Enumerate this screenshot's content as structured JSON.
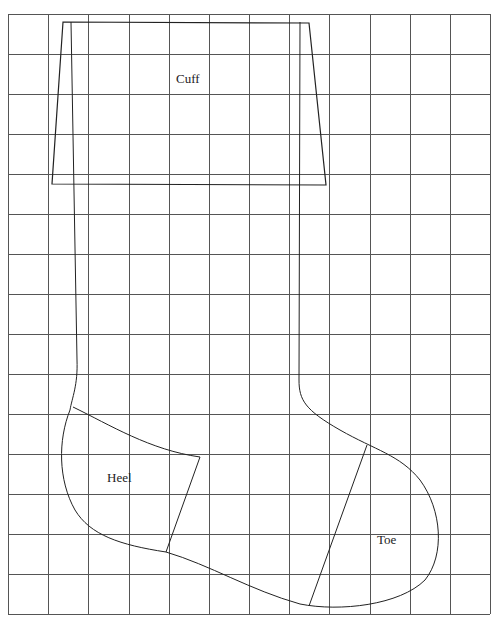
{
  "diagram": {
    "type": "sewing-pattern",
    "background": "#ffffff",
    "line_color": "#333333",
    "grid": {
      "color": "#555555",
      "left": 8,
      "top": 14,
      "right": 490,
      "bottom": 614,
      "columns": 12,
      "rows": 15
    },
    "labels": {
      "cuff": "Cuff",
      "heel": "Heel",
      "toe": "Toe"
    },
    "pieces": [
      {
        "name": "Cuff",
        "shape": "trapezoid"
      },
      {
        "name": "Heel",
        "shape": "curved-quad"
      },
      {
        "name": "Toe",
        "shape": "curved-cap"
      }
    ]
  }
}
